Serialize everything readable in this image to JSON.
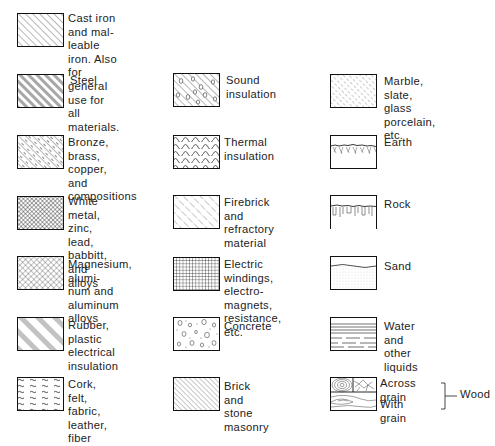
{
  "colors": {
    "line": "#1a1a1a",
    "background": "#ffffff",
    "text": "#222222"
  },
  "columns": [
    {
      "items": [
        {
          "id": "cast-iron",
          "pattern": "diagonal-hatch",
          "label": "Cast iron and mal-\nleable iron. Also for\ngeneral use for all\nmaterials."
        },
        {
          "id": "steel",
          "pattern": "double-diagonal-hatch",
          "label": "Steel"
        },
        {
          "id": "bronze",
          "pattern": "dash-diagonal-hatch",
          "label": "Bronze, brass, copper,\nand compositions"
        },
        {
          "id": "white-metal",
          "pattern": "dense-crosshatch",
          "label": "White metal, zinc,\nlead, babbitt, and\nalloys"
        },
        {
          "id": "magnesium",
          "pattern": "crosshatch",
          "label": "Magnesium, alumi-\nnum and aluminum\nalloys"
        },
        {
          "id": "rubber",
          "pattern": "grouped-diagonal-hatch",
          "label": "Rubber, plastic\nelectrical insulation"
        },
        {
          "id": "cork",
          "pattern": "wavy-dashes",
          "label": "Cork, felt, fabric,\nleather, fiber"
        }
      ]
    },
    {
      "items": [
        {
          "id": "sound-insulation",
          "pattern": "diagonal-with-circles",
          "label": "Sound insulation"
        },
        {
          "id": "thermal-insulation",
          "pattern": "zigzag-waves",
          "label": "Thermal insulation"
        },
        {
          "id": "firebrick",
          "pattern": "dash-dot-diagonal",
          "label": "Firebrick and\nrefractory material"
        },
        {
          "id": "electric-windings",
          "pattern": "grid",
          "label": "Electric windings,\nelectro-magnets,\nresistance, etc."
        },
        {
          "id": "concrete",
          "pattern": "aggregate-dots",
          "label": "Concrete"
        },
        {
          "id": "brick",
          "pattern": "fine-diagonal-hatch",
          "label": "Brick and stone\nmasonry"
        }
      ]
    },
    {
      "items": [
        {
          "id": "marble",
          "pattern": "short-dash-diagonal",
          "label": "Marble, slate, glass\nporcelain, etc."
        },
        {
          "id": "earth",
          "pattern": "earth-strokes",
          "label": "Earth"
        },
        {
          "id": "rock",
          "pattern": "rock-strokes",
          "label": "Rock"
        },
        {
          "id": "sand",
          "pattern": "stipple",
          "label": "Sand"
        },
        {
          "id": "water",
          "pattern": "horizontal-lines",
          "label": "Water and other\nliquids"
        },
        {
          "id": "wood",
          "pattern": "wood-grain",
          "label_across": "Across grain",
          "label_with": "With grain",
          "group_label": "Wood"
        }
      ]
    }
  ]
}
